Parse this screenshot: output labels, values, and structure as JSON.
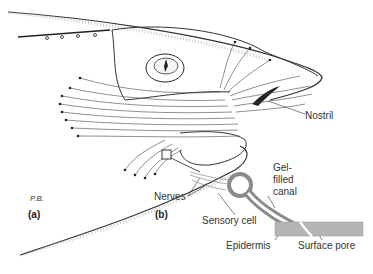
{
  "figure": {
    "panels": [
      {
        "id": "a",
        "label": "(a)",
        "subject": "shark-head-ampullae"
      },
      {
        "id": "b",
        "label": "(b)",
        "subject": "ampulla-detail"
      }
    ],
    "signature": "P.B.",
    "labels": {
      "nostril": "Nostril",
      "nerves": "Nerves",
      "gel_line1": "Gel-",
      "gel_line2": "filled",
      "gel_line3": "canal",
      "sensory_cell": "Sensory cell",
      "epidermis": "Epidermis",
      "surface_pore": "Surface pore"
    },
    "colors": {
      "ink": "#222222",
      "cell": "#8a8a8a",
      "skin": "#b5b5b5"
    }
  }
}
